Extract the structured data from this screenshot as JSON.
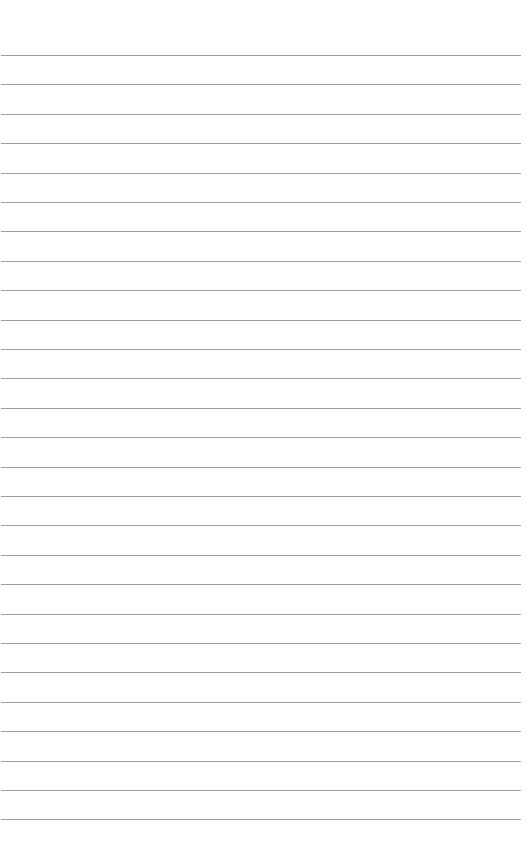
{
  "page": {
    "type": "lined-paper",
    "background": "#ffffff",
    "line_color": "#8c8c8c",
    "line_count": 27,
    "first_line_y": 55,
    "line_spacing": 29.4,
    "line_left": 1,
    "line_width": 520
  }
}
